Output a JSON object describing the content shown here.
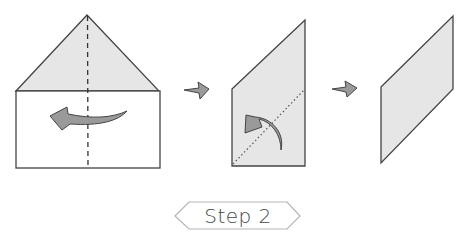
{
  "step_label": "Step 2",
  "colors": {
    "paper_shaded": "#e6e6e6",
    "paper_white": "#ffffff",
    "outline": "#444444",
    "arrow_fill": "#9a9a9a",
    "label_border": "#b5b5b5",
    "label_text": "#444444"
  },
  "figures": [
    {
      "name": "house-shape",
      "description": "Triangle over rectangle with vertical dashed fold line and leftward curved fold arrow"
    },
    {
      "name": "trapezoid-shape",
      "description": "Folded shape with diagonal dotted fold line and upward curved fold arrow"
    },
    {
      "name": "parallelogram-shape",
      "description": "Final parallelogram result"
    }
  ],
  "arrows": [
    "next-arrow",
    "next-arrow"
  ]
}
